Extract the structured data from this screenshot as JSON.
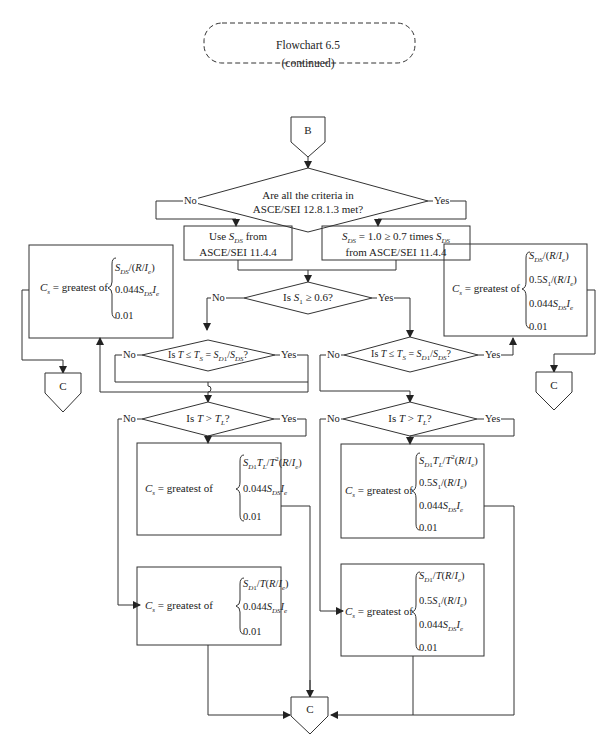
{
  "header": {
    "title_line1": "Flowchart 6.5",
    "title_line2": "(continued)"
  },
  "connectors": {
    "start": "B",
    "end_left": "C",
    "end_right": "C",
    "end_bottom": "C"
  },
  "labels": {
    "yes": "Yes",
    "no": "No"
  },
  "decisions": {
    "criteria_line1": "Are all the criteria in",
    "criteria_line2": "ASCE/SEI 12.8.1.3 met?",
    "s1": "Is S₁ ≥ 0.6?",
    "ts_left": "Is T ≤ Tₛ = S_D1/S_DS?",
    "ts_right": "Is T ≤ Tₛ = S_D1/S_DS?",
    "tl_left": "Is T > T_L?",
    "tl_right": "Is T > T_L?"
  },
  "processes": {
    "use_sds_line1": "Use S_DS from",
    "use_sds_line2": "ASCE/SEI 11.4.4",
    "sds_limit_line1": "S_DS = 1.0 ≥ 0.7 times S_DS",
    "sds_limit_line2": "from ASCE/SEI 11.4.4"
  },
  "formulas": {
    "cs_prefix": "Cₛ = greatest of",
    "box_top_left": [
      "S_DS/(R/I_e)",
      "0.044 S_DS I_e",
      "0.01"
    ],
    "box_top_right": [
      "S_DS/(R/I_e)",
      "0.5 S₁/(R/I_e)",
      "0.044 S_DS I_e",
      "0.01"
    ],
    "box_mid_left": [
      "S_D1 T_L/T²(R/I_e)",
      "0.044 S_DS I_e",
      "0.01"
    ],
    "box_bot_left": [
      "S_D1/T(R/I_e)",
      "0.044 S_DS I_e",
      "0.01"
    ],
    "box_mid_right": [
      "S_D1 T_L/T²(R/I_e)",
      "0.5 S₁/(R/I_e)",
      "0.044 S_DS I_e",
      "0.01"
    ],
    "box_bot_right": [
      "S_D1/T(R/I_e)",
      "0.5 S₁/(R/I_e)",
      "0.044 S_DS I_e",
      "0.01"
    ]
  }
}
